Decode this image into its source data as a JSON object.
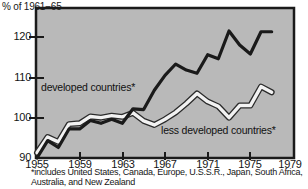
{
  "chart_data": {
    "type": "line",
    "title": "",
    "ylabel": "% of 1961−65",
    "xlabel": "",
    "xlim": [
      1955,
      1979
    ],
    "ylim": [
      90,
      124
    ],
    "yticks": [
      90,
      100,
      110,
      120
    ],
    "xticks": [
      1955,
      1959,
      1963,
      1967,
      1971,
      1975,
      1979
    ],
    "grid": false,
    "legend_position": "inline-annotation",
    "footnote": "*includes United States, Canada, Europe, U.S.S.R., Japan, South Africa, Australia, and New Zealand",
    "background_color": "#b9b9b9",
    "x": [
      1955,
      1956,
      1957,
      1958,
      1959,
      1960,
      1961,
      1962,
      1963,
      1964,
      1965,
      1966,
      1967,
      1968,
      1969,
      1970,
      1971,
      1972,
      1973,
      1974,
      1975,
      1976,
      1977
    ],
    "series": [
      {
        "name": "developed countries*",
        "color": "#1a1a1a",
        "values": [
          90.0,
          94.3,
          92.6,
          97.2,
          97.2,
          99.3,
          98.6,
          99.6,
          98.6,
          102.2,
          102.0,
          106.8,
          110.5,
          113.3,
          111.8,
          111.0,
          115.6,
          114.6,
          121.5,
          118.0,
          115.8,
          121.3,
          121.3
        ]
      },
      {
        "name": "less developed countries*",
        "color": "#f2f2f2",
        "values": [
          91.3,
          95.2,
          94.0,
          98.4,
          98.6,
          100.3,
          100.0,
          100.5,
          100.2,
          101.2,
          99.2,
          98.2,
          99.6,
          101.3,
          103.5,
          106.0,
          104.0,
          102.8,
          100.0,
          103.0,
          103.0,
          107.7,
          106.3
        ]
      }
    ]
  },
  "axis": {
    "y_title": "% of 1961−65",
    "y_tick_labels": [
      "120",
      "110",
      "100",
      "90"
    ],
    "x_tick_labels": [
      "1955",
      "1959",
      "1963",
      "1967",
      "1971",
      "1975",
      "1979"
    ]
  },
  "annotations": {
    "developed": "developed countries*",
    "less_developed": "less developed countries*"
  },
  "footnote": {
    "text": "*includes United States, Canada, Europe, U.S.S.R., Japan, South Africa, Australia, and New Zealand"
  }
}
